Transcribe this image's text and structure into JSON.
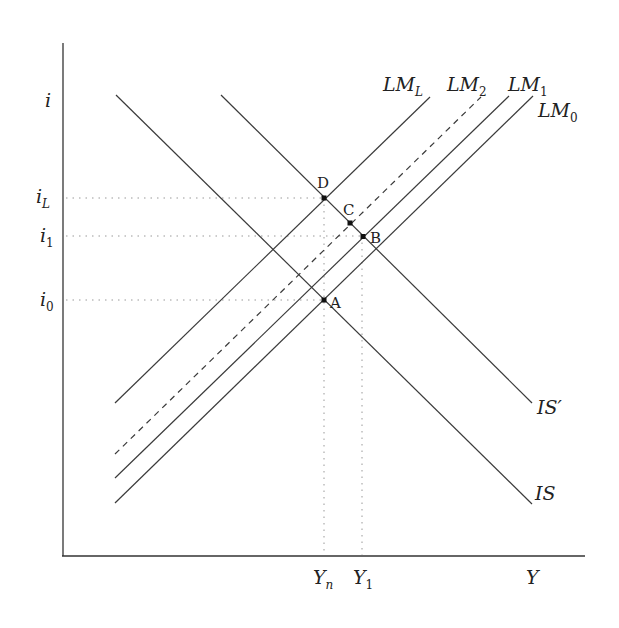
{
  "diagram": {
    "type": "IS-LM",
    "axes": {
      "y_axis_label": "i",
      "x_axis_label": "Y"
    },
    "interest_rate_labels": [
      {
        "id": "iL",
        "base": "i",
        "sub": "L"
      },
      {
        "id": "i1",
        "base": "i",
        "sub": "1"
      },
      {
        "id": "i0",
        "base": "i",
        "sub": "0"
      }
    ],
    "output_labels": [
      {
        "id": "Yn",
        "base": "Y",
        "sub": "n"
      },
      {
        "id": "Y1",
        "base": "Y",
        "sub": "1"
      }
    ],
    "curves": [
      {
        "id": "IS",
        "label": "IS",
        "style": "solid"
      },
      {
        "id": "ISprime",
        "label": "IS′",
        "style": "solid"
      },
      {
        "id": "LML",
        "base": "LM",
        "sub": "L",
        "style": "solid"
      },
      {
        "id": "LM2",
        "base": "LM",
        "sub": "2",
        "style": "dashed"
      },
      {
        "id": "LM1",
        "base": "LM",
        "sub": "1",
        "style": "solid"
      },
      {
        "id": "LM0",
        "base": "LM",
        "sub": "0",
        "style": "solid"
      }
    ],
    "points": [
      {
        "id": "A",
        "label": "A",
        "on": [
          "IS",
          "LML"
        ],
        "at": [
          "Yn",
          "i0"
        ]
      },
      {
        "id": "B",
        "label": "B",
        "on": [
          "ISprime",
          "LM1"
        ],
        "at": [
          "Y1",
          "i1"
        ]
      },
      {
        "id": "C",
        "label": "C",
        "on": [
          "ISprime",
          "LM2"
        ]
      },
      {
        "id": "D",
        "label": "D",
        "on": [
          "ISprime",
          "LML"
        ],
        "at": [
          "Yn",
          "iL"
        ]
      }
    ]
  }
}
